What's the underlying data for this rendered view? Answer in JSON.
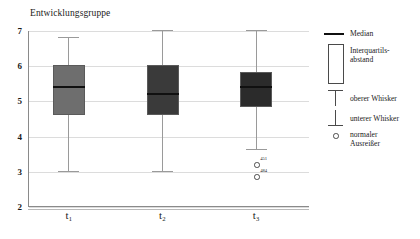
{
  "chart_data": {
    "type": "box",
    "title": "Entwicklungsgruppe",
    "xlabel": "",
    "ylabel": "",
    "ylim": [
      2,
      7
    ],
    "yticks": [
      7,
      6,
      5,
      4,
      3,
      2
    ],
    "grid": true,
    "categories": [
      "t₁",
      "t₂",
      "t₃"
    ],
    "category_labels_plain": [
      "t1",
      "t2",
      "t3"
    ],
    "boxes": [
      {
        "category": "t₁",
        "whisker_high": 6.83,
        "q3": 6.02,
        "median": 5.41,
        "q1": 4.61,
        "whisker_low": 3.01,
        "fill_color": "#6e6e6e",
        "outliers": []
      },
      {
        "category": "t₂",
        "whisker_high": 7.02,
        "q3": 6.03,
        "median": 5.22,
        "q1": 4.62,
        "whisker_low": 3.03,
        "fill_color": "#3a3a3a",
        "outliers": []
      },
      {
        "category": "t₃",
        "whisker_high": 7.03,
        "q3": 5.83,
        "median": 5.42,
        "q1": 4.83,
        "whisker_low": 3.65,
        "fill_color": "#2b2b2b",
        "outliers": [
          {
            "value": 3.22,
            "label": "451"
          },
          {
            "value": 2.87,
            "label": "484"
          }
        ]
      }
    ],
    "legend": {
      "position": "right",
      "entries": [
        {
          "key": "median",
          "label": "Median"
        },
        {
          "key": "iqr",
          "label": "Interquartils-\nabstand",
          "line1": "Interquartils-",
          "line2": "abstand"
        },
        {
          "key": "upper-whisker",
          "label": "oberer Whisker"
        },
        {
          "key": "lower-whisker",
          "label": "unterer Whisker"
        },
        {
          "key": "outlier",
          "label": "normaler\nAusreißer",
          "line1": "normaler",
          "line2": "Ausreißer"
        }
      ]
    },
    "colors": {
      "grid": "#dcdcdc",
      "axis": "#8a8a8a",
      "median": "#101010",
      "whisker": "#9a9a9a",
      "outlier_stroke": "#4a4a4a"
    }
  }
}
